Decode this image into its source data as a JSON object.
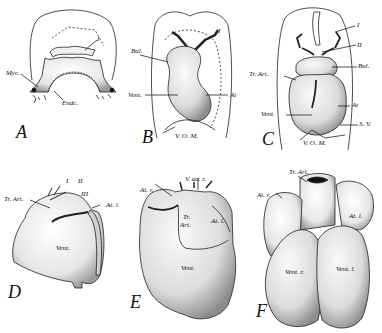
{
  "figure": {
    "panels": [
      {
        "id": "A",
        "letter": "A",
        "labels": {
          "myc": "Myc.",
          "endc": "Endc.",
          "arch1": "I"
        }
      },
      {
        "id": "B",
        "letter": "B",
        "labels": {
          "bul": "Bul.",
          "vent": "Vent.",
          "at": "At",
          "vom": "V. O. M.",
          "arch1": "I"
        }
      },
      {
        "id": "C",
        "letter": "C",
        "labels": {
          "arch1": "I",
          "arch2": "II",
          "bul": "Bul.",
          "trart": "Tr. Art.",
          "at": "At",
          "vent": "Vent.",
          "sv": "S. V.",
          "vom": "V. O. M."
        }
      },
      {
        "id": "D",
        "letter": "D",
        "labels": {
          "arch1": "I",
          "arch2": "II",
          "arch3": "III",
          "trart": "Tr. Art.",
          "atl": "At. l.",
          "vent": "Vent."
        }
      },
      {
        "id": "E",
        "letter": "E",
        "labels": {
          "vaor": "V. ao. r.",
          "atr": "At. r.",
          "trart1": "Tr.",
          "trart2": "Art.",
          "atl": "At. l.",
          "vent": "Vent."
        }
      },
      {
        "id": "F",
        "letter": "F",
        "labels": {
          "trart": "Tr. Art.",
          "atr": "At. r.",
          "atl": "At. l.",
          "ventr": "Vent. r.",
          "ventl": "Vent. l."
        }
      }
    ]
  }
}
